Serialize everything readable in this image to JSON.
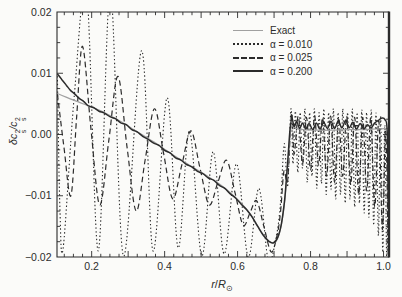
{
  "figure": {
    "background": "#fbfbf9",
    "frame_color": "#2b2b2b",
    "gray_line_color": "#a0a0a0",
    "dark_line_color": "#2b2b2b"
  },
  "ylabel_parts": {
    "base1": "δc",
    "sup": "2",
    "sub": "s",
    "base2": "/c"
  },
  "xlabel_parts": {
    "r": "r",
    "slash": "/",
    "R": "R",
    "sun": "⊙"
  },
  "chart_data": {
    "type": "line",
    "title": "",
    "xlabel": "r/R⊙",
    "ylabel": "δc_s²/c_s²",
    "xlim": [
      0.105,
      1.015
    ],
    "ylim": [
      -0.02,
      0.02
    ],
    "grid": false,
    "legend_position": "upper right",
    "xticks": [
      {
        "v": 0.2,
        "label": "0.2"
      },
      {
        "v": 0.4,
        "label": "0.4"
      },
      {
        "v": 0.6,
        "label": "0.6"
      },
      {
        "v": 0.8,
        "label": "0.8"
      },
      {
        "v": 1.0,
        "label": "1.0"
      }
    ],
    "yticks": [
      {
        "v": 0.02,
        "label": "0.02"
      },
      {
        "v": 0.01,
        "label": "0.01"
      },
      {
        "v": 0.0,
        "label": "0.00"
      },
      {
        "v": -0.01,
        "label": "−0.01"
      },
      {
        "v": -0.02,
        "label": "−0.02"
      }
    ],
    "x_minor_step": 0.025,
    "y_minor_step": 0.0025,
    "series": [
      {
        "name": "Exact",
        "dash": "solid",
        "color": "#a0a0a0",
        "width": 1.2,
        "points": [
          [
            0.106,
            0.0067
          ],
          [
            0.13,
            0.0061
          ],
          [
            0.16,
            0.0054
          ],
          [
            0.19,
            0.0047
          ],
          [
            0.22,
            0.004
          ],
          [
            0.25,
            0.0031
          ],
          [
            0.28,
            0.0021
          ],
          [
            0.31,
            0.001
          ],
          [
            0.34,
            -0.0001
          ],
          [
            0.37,
            -0.0012
          ],
          [
            0.4,
            -0.0024
          ],
          [
            0.43,
            -0.0036
          ],
          [
            0.46,
            -0.0047
          ],
          [
            0.49,
            -0.0058
          ],
          [
            0.52,
            -0.0069
          ],
          [
            0.55,
            -0.0081
          ],
          [
            0.58,
            -0.0095
          ],
          [
            0.61,
            -0.0112
          ],
          [
            0.635,
            -0.013
          ],
          [
            0.655,
            -0.0149
          ],
          [
            0.672,
            -0.0165
          ],
          [
            0.688,
            -0.0175
          ],
          [
            0.7,
            -0.0177
          ],
          [
            0.712,
            -0.0166
          ],
          [
            0.722,
            -0.0141
          ],
          [
            0.731,
            -0.0098
          ],
          [
            0.739,
            -0.0038
          ],
          [
            0.745,
            0.0005
          ],
          [
            0.75,
            0.0014
          ],
          [
            0.76,
            0.001
          ],
          [
            0.78,
            0.0008
          ],
          [
            0.82,
            0.0007
          ],
          [
            0.86,
            0.0007
          ],
          [
            0.9,
            0.0008
          ],
          [
            0.94,
            0.0008
          ],
          [
            0.98,
            0.0009
          ],
          [
            1.015,
            0.001
          ]
        ]
      },
      {
        "name": "α = 0.010",
        "dash": "dotted",
        "color": "#2b2b2b",
        "width": 1.1,
        "points": [
          [
            0.106,
            0.0095
          ],
          [
            0.113,
            -0.012
          ],
          [
            0.122,
            -0.0185
          ],
          [
            0.152,
            0.006
          ],
          [
            0.186,
            0.0235
          ],
          [
            0.218,
            -0.019
          ],
          [
            0.251,
            0.0235
          ],
          [
            0.287,
            -0.0198
          ],
          [
            0.337,
            0.0137
          ],
          [
            0.368,
            -0.019
          ],
          [
            0.407,
            0.006
          ],
          [
            0.437,
            -0.0185
          ],
          [
            0.468,
            0.0006
          ],
          [
            0.502,
            -0.0198
          ],
          [
            0.533,
            -0.0028
          ],
          [
            0.563,
            -0.0195
          ],
          [
            0.597,
            -0.0048
          ],
          [
            0.629,
            -0.02
          ],
          [
            0.658,
            -0.0088
          ],
          [
            0.684,
            -0.0205
          ],
          [
            0.705,
            -0.017
          ],
          [
            0.718,
            -0.011
          ],
          [
            0.728,
            -0.0015
          ],
          [
            0.737,
            -0.0085
          ],
          [
            0.7465,
            0.0042
          ],
          [
            0.752,
            -0.0048
          ],
          [
            0.7585,
            0.0038
          ],
          [
            0.765,
            -0.0062
          ],
          [
            0.7715,
            0.0036
          ],
          [
            0.778,
            -0.0055
          ],
          [
            0.7845,
            0.0042
          ],
          [
            0.791,
            -0.0078
          ],
          [
            0.7975,
            0.0036
          ],
          [
            0.804,
            -0.0068
          ],
          [
            0.8105,
            0.0042
          ],
          [
            0.817,
            -0.0088
          ],
          [
            0.8235,
            0.0036
          ],
          [
            0.83,
            -0.008
          ],
          [
            0.8365,
            0.0042
          ],
          [
            0.843,
            -0.0098
          ],
          [
            0.8495,
            0.0036
          ],
          [
            0.856,
            -0.009
          ],
          [
            0.8625,
            0.0042
          ],
          [
            0.869,
            -0.0105
          ],
          [
            0.8755,
            0.0036
          ],
          [
            0.882,
            -0.0098
          ],
          [
            0.8885,
            0.0042
          ],
          [
            0.895,
            -0.0112
          ],
          [
            0.9015,
            0.0036
          ],
          [
            0.908,
            -0.0105
          ],
          [
            0.9145,
            0.0042
          ],
          [
            0.921,
            -0.0118
          ],
          [
            0.9275,
            0.0036
          ],
          [
            0.934,
            -0.0112
          ],
          [
            0.9405,
            0.004
          ],
          [
            0.947,
            -0.0128
          ],
          [
            0.9535,
            0.0036
          ],
          [
            0.96,
            -0.0135
          ],
          [
            0.9665,
            0.004
          ],
          [
            0.973,
            -0.0148
          ],
          [
            0.9795,
            0.0035
          ],
          [
            0.986,
            -0.0165
          ],
          [
            0.992,
            0.003
          ],
          [
            0.998,
            -0.0192
          ],
          [
            1.0035,
            0.0015
          ],
          [
            1.009,
            -0.0205
          ],
          [
            1.014,
            0.0
          ]
        ]
      },
      {
        "name": "α = 0.025",
        "dash": "dashed",
        "color": "#2b2b2b",
        "width": 1.2,
        "points": [
          [
            0.106,
            0.0066
          ],
          [
            0.124,
            -0.002
          ],
          [
            0.143,
            -0.01
          ],
          [
            0.159,
            0.003
          ],
          [
            0.175,
            0.0144
          ],
          [
            0.198,
            0.001
          ],
          [
            0.222,
            -0.0115
          ],
          [
            0.247,
            -0.001
          ],
          [
            0.272,
            0.0095
          ],
          [
            0.297,
            -0.002
          ],
          [
            0.322,
            -0.0125
          ],
          [
            0.347,
            -0.004
          ],
          [
            0.372,
            0.0042
          ],
          [
            0.397,
            -0.003
          ],
          [
            0.422,
            -0.0105
          ],
          [
            0.447,
            -0.005
          ],
          [
            0.472,
            0.0006
          ],
          [
            0.497,
            -0.0055
          ],
          [
            0.522,
            -0.0115
          ],
          [
            0.546,
            -0.0078
          ],
          [
            0.57,
            -0.0042
          ],
          [
            0.593,
            -0.0095
          ],
          [
            0.615,
            -0.0148
          ],
          [
            0.634,
            -0.0128
          ],
          [
            0.652,
            -0.0108
          ],
          [
            0.672,
            -0.015
          ],
          [
            0.692,
            -0.0192
          ],
          [
            0.708,
            -0.0165
          ],
          [
            0.718,
            -0.0125
          ],
          [
            0.727,
            -0.006
          ],
          [
            0.737,
            -0.0075
          ],
          [
            0.748,
            0.0035
          ],
          [
            0.755,
            -0.0032
          ],
          [
            0.7665,
            0.003
          ],
          [
            0.778,
            -0.0048
          ],
          [
            0.789,
            0.0028
          ],
          [
            0.8,
            -0.0058
          ],
          [
            0.811,
            0.003
          ],
          [
            0.822,
            -0.005
          ],
          [
            0.833,
            0.0028
          ],
          [
            0.844,
            -0.0068
          ],
          [
            0.855,
            0.003
          ],
          [
            0.866,
            -0.0078
          ],
          [
            0.877,
            0.0028
          ],
          [
            0.888,
            -0.0068
          ],
          [
            0.899,
            0.003
          ],
          [
            0.91,
            -0.0082
          ],
          [
            0.921,
            0.0028
          ],
          [
            0.932,
            -0.0098
          ],
          [
            0.943,
            0.0028
          ],
          [
            0.954,
            -0.0092
          ],
          [
            0.965,
            0.0028
          ],
          [
            0.976,
            -0.0118
          ],
          [
            0.987,
            0.0022
          ],
          [
            0.997,
            -0.0155
          ],
          [
            1.006,
            0.0005
          ],
          [
            1.013,
            -0.0198
          ]
        ]
      },
      {
        "name": "α = 0.200",
        "dash": "solid",
        "color": "#2b2b2b",
        "width": 1.5,
        "points": [
          [
            0.106,
            0.0099
          ],
          [
            0.118,
            0.009
          ],
          [
            0.13,
            0.0081
          ],
          [
            0.142,
            0.0072
          ],
          [
            0.154,
            0.0066
          ],
          [
            0.166,
            0.0059
          ],
          [
            0.178,
            0.0054
          ],
          [
            0.19,
            0.0047
          ],
          [
            0.205,
            0.0044
          ],
          [
            0.22,
            0.0038
          ],
          [
            0.235,
            0.0035
          ],
          [
            0.25,
            0.0029
          ],
          [
            0.265,
            0.0026
          ],
          [
            0.28,
            0.0019
          ],
          [
            0.295,
            0.0016
          ],
          [
            0.31,
            0.0008
          ],
          [
            0.325,
            0.0004
          ],
          [
            0.34,
            -0.0003
          ],
          [
            0.355,
            -0.0008
          ],
          [
            0.37,
            -0.0014
          ],
          [
            0.385,
            -0.0018
          ],
          [
            0.4,
            -0.0026
          ],
          [
            0.415,
            -0.003
          ],
          [
            0.43,
            -0.0038
          ],
          [
            0.445,
            -0.0042
          ],
          [
            0.46,
            -0.0049
          ],
          [
            0.475,
            -0.0053
          ],
          [
            0.49,
            -0.006
          ],
          [
            0.505,
            -0.0064
          ],
          [
            0.52,
            -0.0071
          ],
          [
            0.535,
            -0.0075
          ],
          [
            0.55,
            -0.0083
          ],
          [
            0.565,
            -0.0088
          ],
          [
            0.58,
            -0.0097
          ],
          [
            0.595,
            -0.0104
          ],
          [
            0.61,
            -0.0114
          ],
          [
            0.625,
            -0.0123
          ],
          [
            0.64,
            -0.0135
          ],
          [
            0.655,
            -0.015
          ],
          [
            0.67,
            -0.0164
          ],
          [
            0.685,
            -0.0174
          ],
          [
            0.698,
            -0.0177
          ],
          [
            0.71,
            -0.0168
          ],
          [
            0.72,
            -0.0146
          ],
          [
            0.729,
            -0.0106
          ],
          [
            0.737,
            -0.0046
          ],
          [
            0.744,
            0.001
          ],
          [
            0.749,
            0.0026
          ],
          [
            0.755,
            0.0013
          ],
          [
            0.762,
            0.0021
          ],
          [
            0.77,
            0.001
          ],
          [
            0.778,
            0.0019
          ],
          [
            0.787,
            0.0009
          ],
          [
            0.796,
            0.0018
          ],
          [
            0.806,
            0.0008
          ],
          [
            0.816,
            0.0019
          ],
          [
            0.826,
            0.0009
          ],
          [
            0.836,
            0.002
          ],
          [
            0.846,
            0.001
          ],
          [
            0.856,
            0.0021
          ],
          [
            0.866,
            0.001
          ],
          [
            0.876,
            0.0022
          ],
          [
            0.886,
            0.0011
          ],
          [
            0.896,
            0.0023
          ],
          [
            0.906,
            0.0011
          ],
          [
            0.916,
            0.002
          ],
          [
            0.926,
            0.0009
          ],
          [
            0.936,
            0.0018
          ],
          [
            0.946,
            0.0009
          ],
          [
            0.956,
            0.0016
          ],
          [
            0.966,
            0.0011
          ],
          [
            0.976,
            0.0019
          ],
          [
            0.986,
            0.0023
          ],
          [
            0.996,
            0.0027
          ],
          [
            1.004,
            0.0024
          ],
          [
            1.01,
            0.0005
          ],
          [
            1.013,
            -0.0115
          ]
        ]
      }
    ]
  }
}
